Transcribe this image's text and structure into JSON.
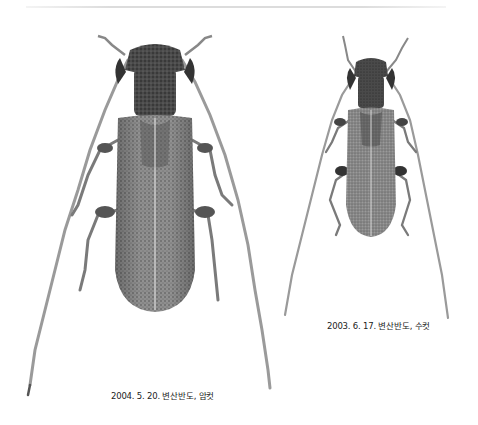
{
  "figure": {
    "background": "#ffffff",
    "specimens": [
      {
        "id": "female",
        "caption": "2004. 5. 20. 변산반도, 암컷",
        "date": "2004. 5. 20.",
        "location": "변산반도",
        "sex": "암컷"
      },
      {
        "id": "male",
        "caption": "2003. 6. 17. 변산반도, 수컷",
        "date": "2003. 6. 17.",
        "location": "변산반도",
        "sex": "수컷"
      }
    ]
  }
}
